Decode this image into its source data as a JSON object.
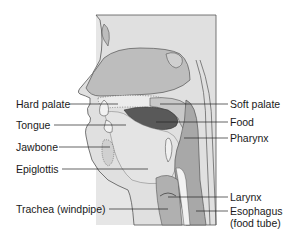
{
  "figure": {
    "type": "anatomical-diagram",
    "background_panel_color": "#e6e6e6",
    "tissue_colors": {
      "skin_outline": "#555555",
      "soft_tissue": "#d9d9d9",
      "cavity": "#bdbdbd",
      "food": "#595959",
      "pharynx_esophagus": "#a8a8a8",
      "bone": "#ececec"
    }
  },
  "labels_left": [
    {
      "id": "hard-palate",
      "text": "Hard palate"
    },
    {
      "id": "tongue",
      "text": "Tongue"
    },
    {
      "id": "jawbone",
      "text": "Jawbone"
    },
    {
      "id": "epiglottis",
      "text": "Epiglottis"
    },
    {
      "id": "trachea",
      "text": "Trachea (windpipe)"
    }
  ],
  "labels_right": [
    {
      "id": "soft-palate",
      "text": "Soft palate"
    },
    {
      "id": "food",
      "text": "Food"
    },
    {
      "id": "pharynx",
      "text": "Pharynx"
    },
    {
      "id": "larynx",
      "text": "Larynx"
    },
    {
      "id": "esophagus",
      "text": "Esophagus"
    },
    {
      "id": "esophagus-sub",
      "text": "(food tube)"
    }
  ]
}
